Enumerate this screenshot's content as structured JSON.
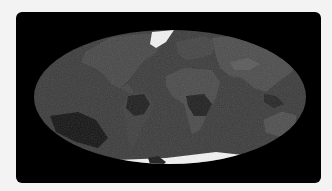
{
  "figure": {
    "projection": "mollweide",
    "description": "Grayscale global map in Mollweide projection",
    "colors": {
      "page_background": "#f3f3f3",
      "card_background": "#000000",
      "ocean": "#3b3b3b",
      "land": "#4a4a4a",
      "land_light": "#585858",
      "dark_region": "#1e1e1e",
      "ice": "#f2f2f2"
    }
  }
}
